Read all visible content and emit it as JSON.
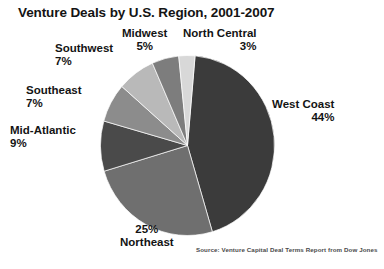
{
  "chart_data": {
    "type": "pie",
    "title": "Venture Deals by U.S. Region, 2001-2007",
    "xlabel": "",
    "ylabel": "",
    "legend_position": "none",
    "grid": false,
    "units": "percent",
    "source": "Source: Venture Capital Deal Terms Report from Dow Jones",
    "categories": [
      "West Coast",
      "Northeast",
      "Mid-Atlantic",
      "Southeast",
      "Southwest",
      "Midwest",
      "North Central"
    ],
    "values": [
      44,
      25,
      9,
      7,
      7,
      5,
      3
    ],
    "slices": [
      {
        "label": "West Coast",
        "value": 44,
        "value_text": "44%",
        "color": "#3b3b3b"
      },
      {
        "label": "Northeast",
        "value": 25,
        "value_text": "25%",
        "color": "#6f6f6f"
      },
      {
        "label": "Mid-Atlantic",
        "value": 9,
        "value_text": "9%",
        "color": "#4a4a4a"
      },
      {
        "label": "Southeast",
        "value": 7,
        "value_text": "7%",
        "color": "#8c8c8c"
      },
      {
        "label": "Southwest",
        "value": 7,
        "value_text": "7%",
        "color": "#b9b9b9"
      },
      {
        "label": "Midwest",
        "value": 5,
        "value_text": "5%",
        "color": "#7d7d7d"
      },
      {
        "label": "North Central",
        "value": 3,
        "value_text": "3%",
        "color": "#d8d8d8"
      }
    ],
    "start_angle_deg": 5,
    "direction": "clockwise",
    "background": "#ffffff",
    "text_color": "#141414"
  },
  "labels": {
    "west_coast": {
      "name": "West Coast",
      "pct": "44%"
    },
    "northeast": {
      "name": "Northeast",
      "pct": "25%"
    },
    "mid_atlantic": {
      "name": "Mid-Atlantic",
      "pct": "9%"
    },
    "southeast": {
      "name": "Southeast",
      "pct": "7%"
    },
    "southwest": {
      "name": "Southwest",
      "pct": "7%"
    },
    "midwest": {
      "name": "Midwest",
      "pct": "5%"
    },
    "north_central": {
      "name": "North Central",
      "pct": "3%"
    }
  }
}
